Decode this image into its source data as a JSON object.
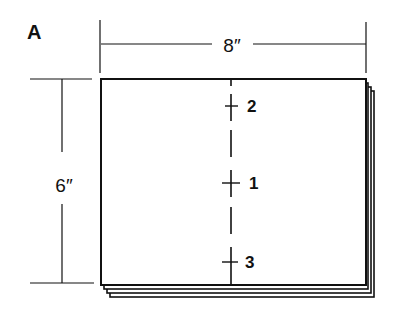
{
  "figure": {
    "panel_label": "A",
    "width_dimension": "8″",
    "height_dimension": "6″",
    "markers": [
      {
        "label": "2",
        "position": "top"
      },
      {
        "label": "1",
        "position": "middle"
      },
      {
        "label": "3",
        "position": "bottom"
      }
    ],
    "stacked_sheets": 4,
    "line_color": "#111111",
    "background": "#ffffff"
  }
}
